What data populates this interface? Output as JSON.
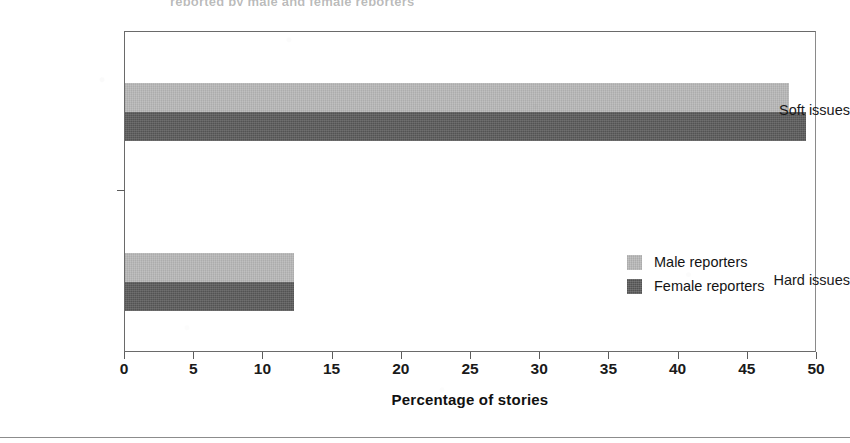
{
  "figure": {
    "clipped_title": "reported by male and female reporters",
    "bottom_rule": true
  },
  "chart_data": {
    "type": "bar",
    "orientation": "horizontal",
    "title": "",
    "subtitle": "",
    "xlabel": "Percentage of stories",
    "ylabel": "",
    "categories": [
      "Soft issues",
      "Hard issues"
    ],
    "series": [
      {
        "name": "Male reporters",
        "color": "#b5b5b5",
        "values": [
          48,
          12.2
        ]
      },
      {
        "name": "Female reporters",
        "color": "#575757",
        "values": [
          49.2,
          12.2
        ]
      }
    ],
    "xlim": [
      0,
      50
    ],
    "xticks": [
      0,
      5,
      10,
      15,
      20,
      25,
      30,
      35,
      40,
      45,
      50
    ],
    "xtick_labels": [
      "0",
      "5",
      "10",
      "15",
      "20",
      "25",
      "30",
      "35",
      "40",
      "45",
      "50"
    ],
    "grid": false,
    "legend": {
      "position": "inside-right",
      "entries": [
        {
          "label": "Male reporters",
          "color": "#b5b5b5",
          "swatch": "legend-swatch-male"
        },
        {
          "label": "Female reporters",
          "color": "#575757",
          "swatch": "legend-swatch-female"
        }
      ]
    },
    "axis_color": "#6a6a6a",
    "background": "#ffffff"
  }
}
